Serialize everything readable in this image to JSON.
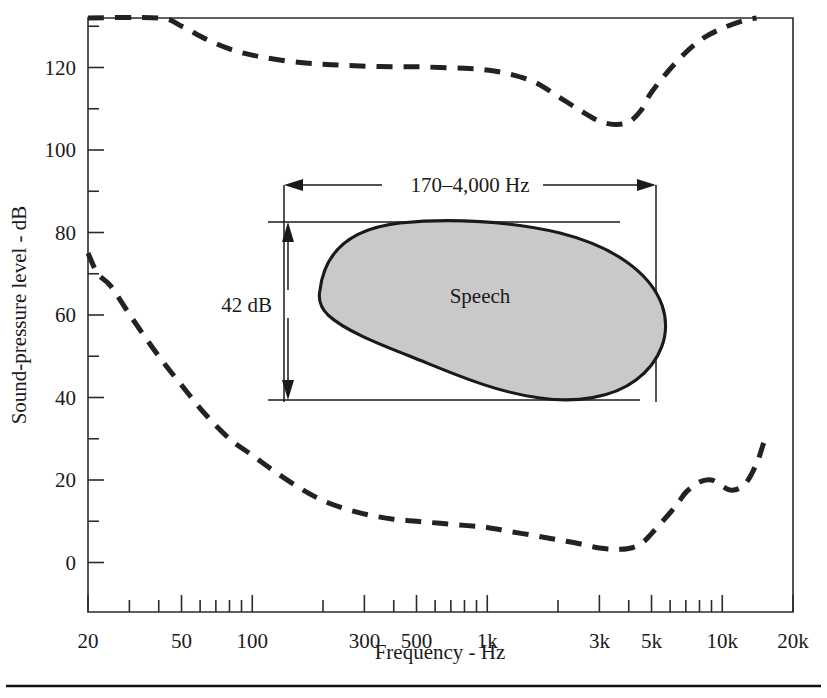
{
  "figure": {
    "background": "#ffffff",
    "ink_color": "#1a1a1a",
    "shade_color": "#c9c9c9"
  },
  "chart_data": {
    "type": "line",
    "title": "",
    "xlabel": "Frequency - Hz",
    "ylabel": "Sound-pressure level - dB",
    "xscale": "log",
    "xlim": [
      20,
      20000
    ],
    "ylim": [
      -12,
      132
    ],
    "grid": false,
    "legend": "none",
    "x_tick_labels": [
      "20",
      "50",
      "100",
      "300",
      "500",
      "1k",
      "3k",
      "5k",
      "10k",
      "20k"
    ],
    "x_tick_values": [
      20,
      50,
      100,
      300,
      500,
      1000,
      3000,
      5000,
      10000,
      20000
    ],
    "x_minor_ticks": [
      30,
      40,
      60,
      70,
      80,
      90,
      200,
      400,
      600,
      700,
      800,
      900,
      2000,
      4000,
      6000,
      7000,
      8000,
      9000
    ],
    "y_tick_labels": [
      "0",
      "20",
      "40",
      "60",
      "80",
      "100",
      "120"
    ],
    "y_tick_values": [
      0,
      20,
      40,
      60,
      80,
      100,
      120
    ],
    "y_minor_ticks": [
      10,
      30,
      50,
      70,
      90,
      110,
      130
    ],
    "series": [
      {
        "name": "threshold-of-feeling (upper dashed curve)",
        "style": "dashed",
        "points": [
          [
            20,
            132
          ],
          [
            40,
            132
          ],
          [
            50,
            130
          ],
          [
            63,
            127
          ],
          [
            80,
            124.5
          ],
          [
            100,
            123
          ],
          [
            125,
            122
          ],
          [
            160,
            121.2
          ],
          [
            200,
            120.8
          ],
          [
            250,
            120.5
          ],
          [
            315,
            120.3
          ],
          [
            400,
            120.2
          ],
          [
            500,
            120.2
          ],
          [
            630,
            120.0
          ],
          [
            800,
            119.8
          ],
          [
            1000,
            119.4
          ],
          [
            1250,
            118.4
          ],
          [
            1600,
            116.4
          ],
          [
            2000,
            113.0
          ],
          [
            2500,
            109.5
          ],
          [
            3000,
            107.0
          ],
          [
            3500,
            106.2
          ],
          [
            4000,
            106.8
          ],
          [
            4500,
            109.5
          ],
          [
            5000,
            114.0
          ],
          [
            6300,
            121.0
          ],
          [
            8000,
            126.5
          ],
          [
            10000,
            129.5
          ],
          [
            12500,
            131.5
          ],
          [
            14000,
            132
          ]
        ]
      },
      {
        "name": "threshold-of-hearing (lower dashed curve)",
        "style": "dashed",
        "points": [
          [
            20,
            75
          ],
          [
            22,
            70
          ],
          [
            25,
            67
          ],
          [
            31,
            59
          ],
          [
            40,
            50
          ],
          [
            50,
            43
          ],
          [
            63,
            36
          ],
          [
            80,
            30
          ],
          [
            100,
            26
          ],
          [
            125,
            22
          ],
          [
            160,
            18
          ],
          [
            200,
            15
          ],
          [
            250,
            13
          ],
          [
            315,
            11.5
          ],
          [
            400,
            10.5
          ],
          [
            500,
            10.0
          ],
          [
            630,
            9.5
          ],
          [
            800,
            9.0
          ],
          [
            1000,
            8.5
          ],
          [
            1250,
            7.5
          ],
          [
            1600,
            6.5
          ],
          [
            2000,
            5.5
          ],
          [
            2500,
            4.5
          ],
          [
            3000,
            3.5
          ],
          [
            3500,
            3.2
          ],
          [
            4000,
            3.4
          ],
          [
            4500,
            4.5
          ],
          [
            5000,
            7.0
          ],
          [
            6300,
            13.5
          ],
          [
            7000,
            17.0
          ],
          [
            8000,
            19.5
          ],
          [
            9000,
            20.0
          ],
          [
            10000,
            18.5
          ],
          [
            11000,
            17.5
          ],
          [
            12500,
            19.0
          ],
          [
            14000,
            24.0
          ],
          [
            15000,
            29.0
          ]
        ]
      }
    ],
    "annotations": [
      {
        "id": "speech-region",
        "label": "Speech",
        "type": "shaded-region",
        "frequency_span_label": "170–4,000 Hz",
        "level_span_label": "42 dB",
        "frequency_span": [
          170,
          4000
        ],
        "level_span": [
          42,
          84
        ]
      }
    ]
  },
  "labels": {
    "speech": "Speech",
    "freq_span": "170–4,000 Hz",
    "level_span": "42 dB",
    "x_title": "Frequency - Hz",
    "y_title": "Sound-pressure level - dB",
    "x_ticks": [
      "20",
      "50",
      "100",
      "300",
      "500",
      "1k",
      "3k",
      "5k",
      "10k",
      "20k"
    ],
    "y_ticks": [
      "0",
      "20",
      "40",
      "60",
      "80",
      "100",
      "120"
    ]
  }
}
